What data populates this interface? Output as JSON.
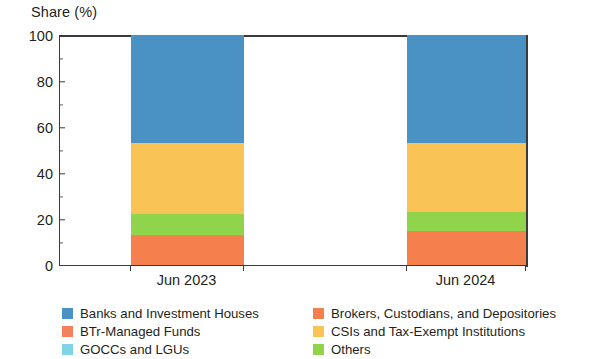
{
  "chart_data": {
    "type": "bar",
    "subtype": "stacked-bar-100",
    "title": "Share (%)",
    "ylabel": "Share (%)",
    "xlabel": "",
    "categories": [
      "Jun 2023",
      "Jun 2024"
    ],
    "ylim": [
      0,
      100
    ],
    "yticks": [
      0,
      20,
      40,
      60,
      80,
      100
    ],
    "ytick_labels": [
      "0",
      "20",
      "40",
      "60",
      "80",
      "100"
    ],
    "yminor_ticks": [
      10,
      30,
      50,
      70,
      90
    ],
    "grid": false,
    "legend_position": "bottom",
    "legend_columns": 2,
    "series": [
      {
        "name": "Banks and Investment Houses",
        "color": "#4A92C4",
        "values": [
          47,
          47
        ]
      },
      {
        "name": "Brokers, Custodians, and Depositories",
        "color": "#F5804E",
        "values": [
          13,
          15
        ]
      },
      {
        "name": "BTr-Managed Funds",
        "color": "#F4815C",
        "values": [
          0,
          0
        ]
      },
      {
        "name": "CSIs and Tax-Exempt Institutions",
        "color": "#F9C356",
        "values": [
          31,
          30
        ]
      },
      {
        "name": "GOCCs and LGUs",
        "color": "#7FD4E8",
        "values": [
          0,
          0
        ]
      },
      {
        "name": "Others",
        "color": "#8FD44A",
        "values": [
          9,
          8
        ]
      }
    ],
    "stack_order_bottom_to_top": [
      "Brokers, Custodians, and Depositories",
      "Others",
      "CSIs and Tax-Exempt Institutions",
      "Banks and Investment Houses"
    ]
  },
  "axis": {
    "title": "Share (%)",
    "y_tick_labels": [
      "100",
      "80",
      "60",
      "40",
      "20",
      "0"
    ],
    "x_tick_labels": [
      "Jun 2023",
      "Jun 2024"
    ]
  },
  "legend": {
    "rows": [
      {
        "left": {
          "label": "Banks and Investment Houses",
          "color": "#4A92C4"
        },
        "right": {
          "label": "Brokers, Custodians, and Depositories",
          "color": "#F5804E"
        }
      },
      {
        "left": {
          "label": "BTr-Managed Funds",
          "color": "#F4815C"
        },
        "right": {
          "label": "CSIs and Tax-Exempt Institutions",
          "color": "#F9C356"
        }
      },
      {
        "left": {
          "label": "GOCCs and LGUs",
          "color": "#7FD4E8"
        },
        "right": {
          "label": "Others",
          "color": "#8FD44A"
        }
      }
    ]
  }
}
